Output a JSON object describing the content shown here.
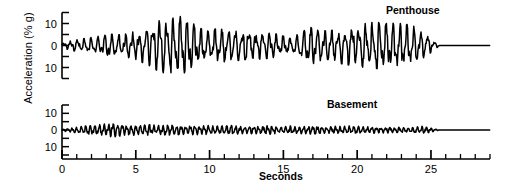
{
  "figure": {
    "ylabel": "Acceleration (% g)",
    "xlabel": "Seconds"
  },
  "chart_data": {
    "type": "line",
    "title": "",
    "xlabel": "Seconds",
    "ylabel": "Acceleration (% g)",
    "xlim": [
      0,
      29
    ],
    "xticks": [
      0,
      5,
      10,
      15,
      20,
      25
    ],
    "xtick_labels": [
      "0",
      "5",
      "10",
      "15",
      "20",
      "25"
    ],
    "x_minor_tick_interval": 1,
    "grid": false,
    "legend": "none",
    "panels": [
      {
        "name": "Penthouse",
        "label": "Penthouse",
        "ylim": [
          -15,
          15
        ],
        "yticks": [
          10,
          0,
          10
        ],
        "ytick_labels": [
          "10",
          "0",
          "10"
        ],
        "ytick_values": [
          10,
          0,
          -10
        ],
        "signal_end_seconds": 25.6,
        "peak_amplitude_percent_g": 13,
        "color": "#000000",
        "description": "Penthouse acceleration record: strong motion with two bursts, largest peaks near 7-9 s and 21-24 s, decaying to zero after 25.6 s",
        "envelope_points": [
          {
            "t": 0.0,
            "amp": 1.0
          },
          {
            "t": 0.5,
            "amp": 2.0
          },
          {
            "t": 1.0,
            "amp": 2.5
          },
          {
            "t": 1.5,
            "amp": 3.0
          },
          {
            "t": 2.0,
            "amp": 3.5
          },
          {
            "t": 2.5,
            "amp": 4.0
          },
          {
            "t": 3.0,
            "amp": 4.5
          },
          {
            "t": 3.5,
            "amp": 5.0
          },
          {
            "t": 4.0,
            "amp": 4.5
          },
          {
            "t": 4.5,
            "amp": 5.5
          },
          {
            "t": 5.0,
            "amp": 6.0
          },
          {
            "t": 5.5,
            "amp": 7.5
          },
          {
            "t": 6.0,
            "amp": 9.0
          },
          {
            "t": 6.5,
            "amp": 11.0
          },
          {
            "t": 7.0,
            "amp": 13.0
          },
          {
            "t": 7.5,
            "amp": 12.5
          },
          {
            "t": 8.0,
            "amp": 13.0
          },
          {
            "t": 8.5,
            "amp": 11.0
          },
          {
            "t": 9.0,
            "amp": 9.0
          },
          {
            "t": 9.5,
            "amp": 7.0
          },
          {
            "t": 10.0,
            "amp": 6.0
          },
          {
            "t": 10.5,
            "amp": 7.5
          },
          {
            "t": 11.0,
            "amp": 7.0
          },
          {
            "t": 11.5,
            "amp": 6.0
          },
          {
            "t": 12.0,
            "amp": 6.5
          },
          {
            "t": 12.5,
            "amp": 6.0
          },
          {
            "t": 13.0,
            "amp": 5.5
          },
          {
            "t": 13.5,
            "amp": 6.0
          },
          {
            "t": 14.0,
            "amp": 5.5
          },
          {
            "t": 14.5,
            "amp": 5.0
          },
          {
            "t": 15.0,
            "amp": 4.0
          },
          {
            "t": 15.5,
            "amp": 3.0
          },
          {
            "t": 16.0,
            "amp": 5.0
          },
          {
            "t": 16.5,
            "amp": 7.0
          },
          {
            "t": 17.0,
            "amp": 8.0
          },
          {
            "t": 17.5,
            "amp": 7.0
          },
          {
            "t": 18.0,
            "amp": 6.0
          },
          {
            "t": 18.5,
            "amp": 7.0
          },
          {
            "t": 19.0,
            "amp": 8.0
          },
          {
            "t": 19.5,
            "amp": 8.5
          },
          {
            "t": 20.0,
            "amp": 9.0
          },
          {
            "t": 20.5,
            "amp": 9.5
          },
          {
            "t": 21.0,
            "amp": 10.0
          },
          {
            "t": 21.5,
            "amp": 10.0
          },
          {
            "t": 22.0,
            "amp": 9.5
          },
          {
            "t": 22.5,
            "amp": 10.0
          },
          {
            "t": 23.0,
            "amp": 9.5
          },
          {
            "t": 23.5,
            "amp": 9.0
          },
          {
            "t": 24.0,
            "amp": 8.0
          },
          {
            "t": 24.5,
            "amp": 6.0
          },
          {
            "t": 25.0,
            "amp": 3.0
          },
          {
            "t": 25.3,
            "amp": 1.5
          },
          {
            "t": 25.6,
            "amp": 0.0
          },
          {
            "t": 29.0,
            "amp": 0.0
          }
        ]
      },
      {
        "name": "Basement",
        "label": "Basement",
        "ylim": [
          -15,
          15
        ],
        "yticks": [
          10,
          0,
          10
        ],
        "ytick_labels": [
          "10",
          "0",
          "10"
        ],
        "ytick_values": [
          10,
          0,
          -10
        ],
        "signal_end_seconds": 25.6,
        "peak_amplitude_percent_g": 4,
        "color": "#000000",
        "description": "Basement acceleration record: low-amplitude high-frequency ground motion, peaks about 4% g near 3-5 s, decaying to zero after 25.6 s",
        "envelope_points": [
          {
            "t": 0.0,
            "amp": 0.6
          },
          {
            "t": 0.5,
            "amp": 1.0
          },
          {
            "t": 1.0,
            "amp": 1.8
          },
          {
            "t": 1.5,
            "amp": 2.2
          },
          {
            "t": 2.0,
            "amp": 2.6
          },
          {
            "t": 2.5,
            "amp": 3.0
          },
          {
            "t": 3.0,
            "amp": 3.6
          },
          {
            "t": 3.5,
            "amp": 4.0
          },
          {
            "t": 4.0,
            "amp": 3.4
          },
          {
            "t": 4.5,
            "amp": 3.0
          },
          {
            "t": 5.0,
            "amp": 3.2
          },
          {
            "t": 5.5,
            "amp": 2.8
          },
          {
            "t": 6.0,
            "amp": 3.0
          },
          {
            "t": 6.5,
            "amp": 2.6
          },
          {
            "t": 7.0,
            "amp": 2.8
          },
          {
            "t": 7.5,
            "amp": 3.0
          },
          {
            "t": 8.0,
            "amp": 2.6
          },
          {
            "t": 8.5,
            "amp": 2.4
          },
          {
            "t": 9.0,
            "amp": 2.8
          },
          {
            "t": 9.5,
            "amp": 2.4
          },
          {
            "t": 10.0,
            "amp": 2.6
          },
          {
            "t": 10.5,
            "amp": 2.2
          },
          {
            "t": 11.0,
            "amp": 2.4
          },
          {
            "t": 11.5,
            "amp": 2.6
          },
          {
            "t": 12.0,
            "amp": 2.2
          },
          {
            "t": 12.5,
            "amp": 2.0
          },
          {
            "t": 13.0,
            "amp": 2.4
          },
          {
            "t": 13.5,
            "amp": 2.2
          },
          {
            "t": 14.0,
            "amp": 2.6
          },
          {
            "t": 14.5,
            "amp": 2.0
          },
          {
            "t": 15.0,
            "amp": 1.8
          },
          {
            "t": 15.5,
            "amp": 2.4
          },
          {
            "t": 16.0,
            "amp": 2.0
          },
          {
            "t": 16.5,
            "amp": 2.2
          },
          {
            "t": 17.0,
            "amp": 2.4
          },
          {
            "t": 17.5,
            "amp": 2.0
          },
          {
            "t": 18.0,
            "amp": 1.8
          },
          {
            "t": 18.5,
            "amp": 2.2
          },
          {
            "t": 19.0,
            "amp": 2.0
          },
          {
            "t": 19.5,
            "amp": 2.4
          },
          {
            "t": 20.0,
            "amp": 2.2
          },
          {
            "t": 20.5,
            "amp": 1.8
          },
          {
            "t": 21.0,
            "amp": 2.0
          },
          {
            "t": 21.5,
            "amp": 1.6
          },
          {
            "t": 22.0,
            "amp": 1.8
          },
          {
            "t": 22.5,
            "amp": 1.4
          },
          {
            "t": 23.0,
            "amp": 1.6
          },
          {
            "t": 23.5,
            "amp": 1.2
          },
          {
            "t": 24.0,
            "amp": 2.0
          },
          {
            "t": 24.5,
            "amp": 2.2
          },
          {
            "t": 25.0,
            "amp": 1.2
          },
          {
            "t": 25.3,
            "amp": 0.6
          },
          {
            "t": 25.6,
            "amp": 0.0
          },
          {
            "t": 29.0,
            "amp": 0.0
          }
        ]
      }
    ]
  }
}
